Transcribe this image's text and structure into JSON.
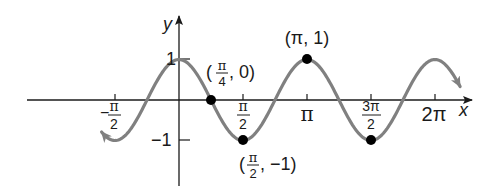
{
  "chart_data": {
    "type": "line",
    "function": "y = cos(2x)",
    "xlabel": "x",
    "ylabel": "y",
    "xlim": [
      -2.2,
      7.0
    ],
    "ylim": [
      -1.6,
      1.6
    ],
    "grid": false,
    "x_ticks": [
      {
        "value": -1.5708,
        "label_num": "π",
        "label_den": "2",
        "sign": "−"
      },
      {
        "value": 1.5708,
        "label_num": "π",
        "label_den": "2",
        "sign": ""
      },
      {
        "value": 3.1416,
        "label": "π"
      },
      {
        "value": 4.7124,
        "label_num": "3π",
        "label_den": "2",
        "sign": ""
      },
      {
        "value": 6.2832,
        "label": "2π"
      }
    ],
    "y_ticks": [
      {
        "value": 1,
        "label": "1"
      },
      {
        "value": -1,
        "label": "−1"
      }
    ],
    "highlighted_points": [
      {
        "x": 0.7854,
        "y": 0,
        "label": "(π/4, 0)"
      },
      {
        "x": 1.5708,
        "y": -1,
        "label": "(π/2, −1)"
      },
      {
        "x": 3.1416,
        "y": 1,
        "label": "(π, 1)"
      },
      {
        "x": 4.7124,
        "y": -1,
        "label": ""
      }
    ],
    "series": [
      {
        "name": "cos(2x)",
        "color": "#808080",
        "x_range": [
          -1.9,
          6.9
        ]
      }
    ]
  },
  "labels": {
    "x_axis": "x",
    "y_axis": "y",
    "y_tick_pos": "1",
    "y_tick_neg": "−1",
    "tick_neg_half_pi_sign": "−",
    "pi": "π",
    "two": "2",
    "three_pi": "3π",
    "two_pi": "2π",
    "four": "4",
    "pt_pi4_open": "(",
    "pt_pi4_close": ", 0)",
    "pt_pi_1": "(π, 1)",
    "pt_pi2_open": "(",
    "pt_pi2_close": ", −1)"
  },
  "colors": {
    "curve": "#808080",
    "axis": "#1a1a1a",
    "point": "#000000"
  }
}
